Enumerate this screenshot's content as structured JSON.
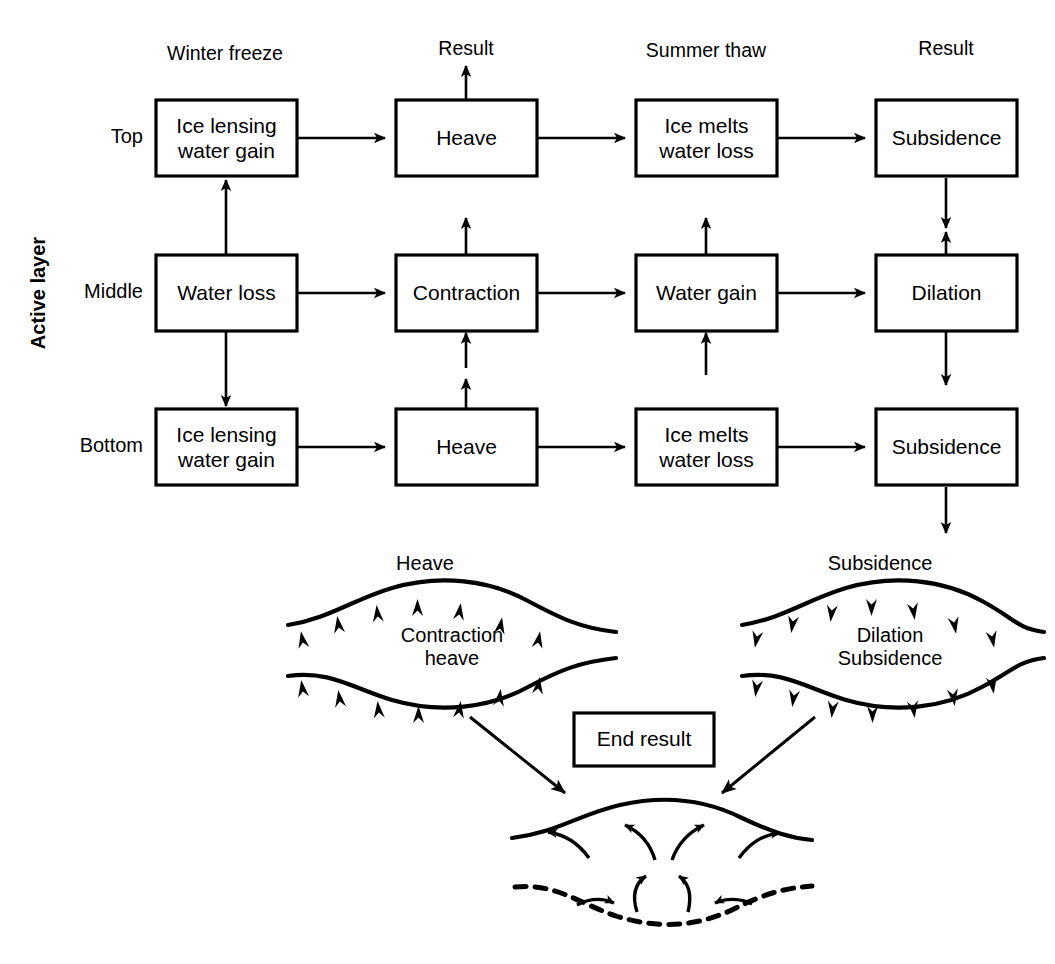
{
  "figure": {
    "axis_label": "Active layer",
    "ink_color": "#000000",
    "background_color": "#ffffff"
  },
  "columns": [
    {
      "id": "winter-freeze",
      "label": "Winter freeze"
    },
    {
      "id": "result-1",
      "label": "Result"
    },
    {
      "id": "summer-thaw",
      "label": "Summer thaw"
    },
    {
      "id": "result-2",
      "label": "Result"
    }
  ],
  "rows": [
    {
      "id": "top",
      "label": "Top"
    },
    {
      "id": "middle",
      "label": "Middle"
    },
    {
      "id": "bottom",
      "label": "Bottom"
    }
  ],
  "boxes": {
    "top_winter": {
      "line1": "Ice lensing",
      "line2": "water gain"
    },
    "top_result1": {
      "line1": "Heave"
    },
    "top_summer": {
      "line1": "Ice melts",
      "line2": "water loss"
    },
    "top_result2": {
      "line1": "Subsidence"
    },
    "mid_winter": {
      "line1": "Water loss"
    },
    "mid_result1": {
      "line1": "Contraction"
    },
    "mid_summer": {
      "line1": "Water gain"
    },
    "mid_result2": {
      "line1": "Dilation"
    },
    "bot_winter": {
      "line1": "Ice lensing",
      "line2": "water gain"
    },
    "bot_result1": {
      "line1": "Heave"
    },
    "bot_summer": {
      "line1": "Ice melts",
      "line2": "water loss"
    },
    "bot_result2": {
      "line1": "Subsidence"
    }
  },
  "lenses": {
    "left": {
      "title": "Subsidence placeholder left",
      "heading": "Heave",
      "inner_line1": "Contraction",
      "inner_line2": "heave",
      "arrow_direction": "up"
    },
    "right": {
      "heading": "Subsidence",
      "inner_line1": "Dilation",
      "inner_line2": "Subsidence",
      "arrow_direction": "down"
    }
  },
  "end_result": {
    "label": "End result"
  }
}
